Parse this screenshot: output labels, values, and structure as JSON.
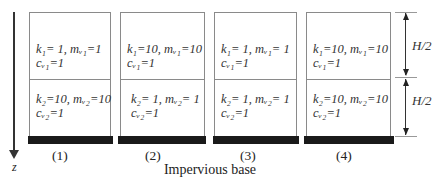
{
  "axis": {
    "label": "z"
  },
  "columns": [
    {
      "caption": "(1)",
      "layer1": {
        "line1": "k₁= 1, mᵥ₁=1",
        "line2": "cᵥ₁=1"
      },
      "layer2": {
        "line1": "k₂=10, mᵥ₂=10",
        "line2": "cᵥ₂=1"
      }
    },
    {
      "caption": "(2)",
      "layer1": {
        "line1": "k₁=10, mᵥ₁=10",
        "line2": "cᵥ₁=1"
      },
      "layer2": {
        "line1": "k₂= 1, mᵥ₂= 1",
        "line2": "cᵥ₂=1"
      }
    },
    {
      "caption": "(3)",
      "layer1": {
        "line1": "k₁= 1, mᵥ₁= 1",
        "line2": "cᵥ₁=1"
      },
      "layer2": {
        "line1": "k₂= 1, mᵥ₂= 1",
        "line2": "cᵥ₂=1"
      }
    },
    {
      "caption": "(4)",
      "layer1": {
        "line1": "k₁=10, mᵥ₁=10",
        "line2": "cᵥ₁=1"
      },
      "layer2": {
        "line1": "k₂=10, mᵥ₂=10",
        "line2": "cᵥ₂=1"
      }
    }
  ],
  "dimensions": {
    "upper": "H/2",
    "lower": "H/2"
  },
  "base_label": "Impervious base"
}
